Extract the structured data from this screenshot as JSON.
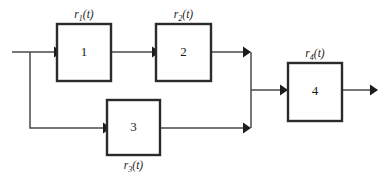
{
  "diagram": {
    "type": "block-diagram",
    "title": "",
    "canvas": {
      "width": 387,
      "height": 180,
      "background": "#ffffff"
    },
    "colors": {
      "block_stroke": "#2b2b2b",
      "block_fill": "#ffffff",
      "wire": "#4a4a4a",
      "arrowhead": "#1c1c1c",
      "text": "#1c1c1c"
    },
    "blocks": [
      {
        "id": "block-1",
        "number": "1",
        "label_base": "r",
        "label_sub": "1",
        "label_tail": "(t)",
        "label_text": "r1(t)",
        "label_position": "above",
        "x": 57,
        "y": 24,
        "w": 54,
        "h": 57
      },
      {
        "id": "block-2",
        "number": "2",
        "label_base": "r",
        "label_sub": "2",
        "label_tail": "(t)",
        "label_text": "r2(t)",
        "label_position": "above",
        "x": 156,
        "y": 24,
        "w": 55,
        "h": 57
      },
      {
        "id": "block-3",
        "number": "3",
        "label_base": "r",
        "label_sub": "3",
        "label_tail": "(t)",
        "label_text": "r3(t)",
        "label_position": "below",
        "x": 107,
        "y": 100,
        "w": 53,
        "h": 55
      },
      {
        "id": "block-4",
        "number": "4",
        "label_base": "r",
        "label_sub": "4",
        "label_tail": "(t)",
        "label_text": "r4(t)",
        "label_position": "above",
        "x": 288,
        "y": 63,
        "w": 54,
        "h": 58
      }
    ],
    "connections": [
      {
        "id": "wire-input-to-block-1",
        "from": "input",
        "to": "block-1",
        "arrow": true
      },
      {
        "id": "wire-input-branch-down",
        "from": "input-node",
        "to": "block-3",
        "arrow": true
      },
      {
        "id": "wire-block-1-to-block-2",
        "from": "block-1",
        "to": "block-2",
        "arrow": true
      },
      {
        "id": "wire-block-2-to-junction",
        "from": "block-2",
        "to": "summing-junction",
        "arrow": true
      },
      {
        "id": "wire-block-3-to-junction",
        "from": "block-3",
        "to": "summing-junction",
        "arrow": true
      },
      {
        "id": "wire-junction-to-block-4",
        "from": "summing-junction",
        "to": "block-4",
        "arrow": true
      },
      {
        "id": "wire-block-4-to-output",
        "from": "block-4",
        "to": "output",
        "arrow": true
      }
    ],
    "junction": {
      "id": "summing-junction",
      "x": 251,
      "y_top": 52,
      "y_bottom": 128,
      "out_y": 90
    }
  }
}
